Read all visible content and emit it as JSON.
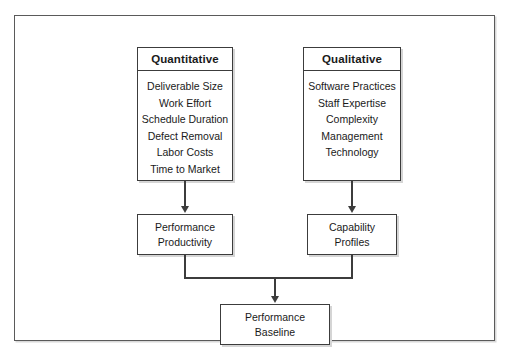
{
  "diagram": {
    "colors": {
      "background": "#ffffff",
      "box_border": "#3c3c3c",
      "frame_border": "#5a5a5a",
      "text": "#1a1a1a",
      "shadow": "#d5d5d5"
    },
    "nodes": {
      "quantitative": {
        "header": "Quantitative",
        "items": [
          "Deliverable Size",
          "Work Effort",
          "Schedule Duration",
          "Defect Removal",
          "Labor Costs",
          "Time to Market"
        ]
      },
      "qualitative": {
        "header": "Qualitative",
        "items": [
          "Software Practices",
          "Staff Expertise",
          "Complexity",
          "Management",
          "Technology"
        ]
      },
      "performance_productivity": {
        "label": "Performance\nProductivity"
      },
      "capability_profiles": {
        "label": "Capability\nProfiles"
      },
      "performance_baseline": {
        "label": "Performance\nBaseline"
      }
    },
    "edges": [
      {
        "from": "quantitative",
        "to": "performance_productivity",
        "marker": "arrow-down"
      },
      {
        "from": "qualitative",
        "to": "capability_profiles",
        "marker": "arrow-down"
      },
      {
        "from": "performance_productivity",
        "to": "performance_baseline",
        "marker": "arrow-down"
      },
      {
        "from": "capability_profiles",
        "to": "performance_baseline",
        "marker": "arrow-down"
      }
    ]
  }
}
